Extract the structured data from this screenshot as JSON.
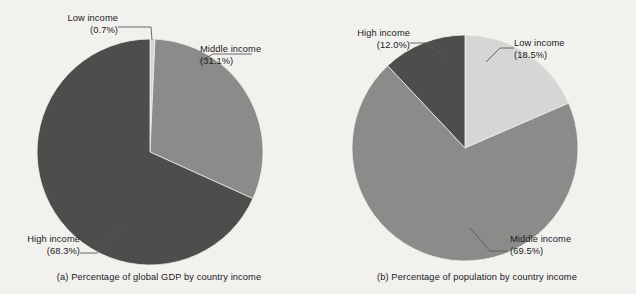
{
  "figure": {
    "background_color": "#f3f1ee",
    "width": 636,
    "height": 294
  },
  "palette": {
    "low_income": "#d6d6d4",
    "middle_income": "#8b8b89",
    "high_income": "#4d4d4c",
    "leader_line": "#5a5a58",
    "text": "#20201f"
  },
  "panels": [
    {
      "id": "a",
      "caption": "(a) Percentage of global GDP by country income",
      "labels": {
        "low": {
          "name": "Low income",
          "pct": "(0.7%)"
        },
        "middle": {
          "name": "Middle income",
          "pct": "(31.1%)"
        },
        "high": {
          "name": "High income",
          "pct": "(68.3%)"
        }
      }
    },
    {
      "id": "b",
      "caption": "(b) Percentage of population by country income",
      "labels": {
        "low": {
          "name": "Low income",
          "pct": "(18.5%)"
        },
        "middle": {
          "name": "Middle income",
          "pct": "(69.5%)"
        },
        "high": {
          "name": "High income",
          "pct": "(12.0%)"
        }
      }
    }
  ],
  "chart_data": [
    {
      "type": "pie",
      "title": "(a) Percentage of global GDP by country income",
      "labels": [
        "Low income",
        "Middle income",
        "High income"
      ],
      "values": [
        0.7,
        31.1,
        68.3
      ],
      "value_labels": [
        "(0.7%)",
        "(31.1%)",
        "(68.3%)"
      ],
      "colors": [
        "#d6d6d4",
        "#8b8b89",
        "#4d4d4c"
      ],
      "units": "percent",
      "start_angle_deg": 90,
      "direction": "clockwise",
      "legend": "none",
      "grid": false,
      "annotations": [
        "leader lines from each wedge to its outside label"
      ]
    },
    {
      "type": "pie",
      "title": "(b) Percentage of population by country income",
      "labels": [
        "Low income",
        "Middle income",
        "High income"
      ],
      "values": [
        18.5,
        69.5,
        12.0
      ],
      "value_labels": [
        "(18.5%)",
        "(69.5%)",
        "(12.0%)"
      ],
      "colors": [
        "#d6d6d4",
        "#8b8b89",
        "#4d4d4c"
      ],
      "units": "percent",
      "start_angle_deg": 90,
      "direction": "clockwise",
      "legend": "none",
      "grid": false,
      "annotations": [
        "leader lines from each wedge to its outside label"
      ]
    }
  ]
}
